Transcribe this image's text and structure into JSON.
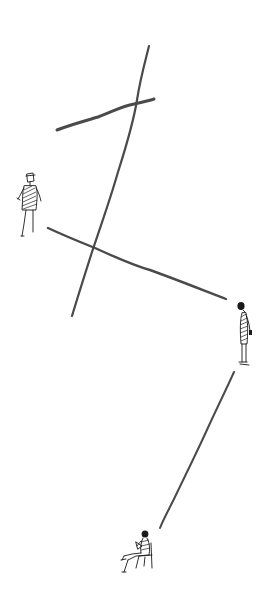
{
  "scene": {
    "description": "Hand-drawn ink sketch: three small human figures connected by loose pencil lines on a white background",
    "background_color": "#ffffff",
    "ink_color": "#1a1a1a",
    "line_color": "#4a4a4a",
    "elements": [
      {
        "id": "crossing-line-vertical",
        "kind": "line"
      },
      {
        "id": "crossing-line-short",
        "kind": "line"
      },
      {
        "id": "diagonal-line",
        "kind": "line"
      },
      {
        "id": "lower-line",
        "kind": "line"
      },
      {
        "id": "figure-standing-front",
        "kind": "figure",
        "pose": "standing, facing viewer"
      },
      {
        "id": "figure-standing-profile",
        "kind": "figure",
        "pose": "standing in profile, head bowed"
      },
      {
        "id": "figure-seated",
        "kind": "figure",
        "pose": "seated on chair, legs crossed, reading"
      }
    ]
  }
}
